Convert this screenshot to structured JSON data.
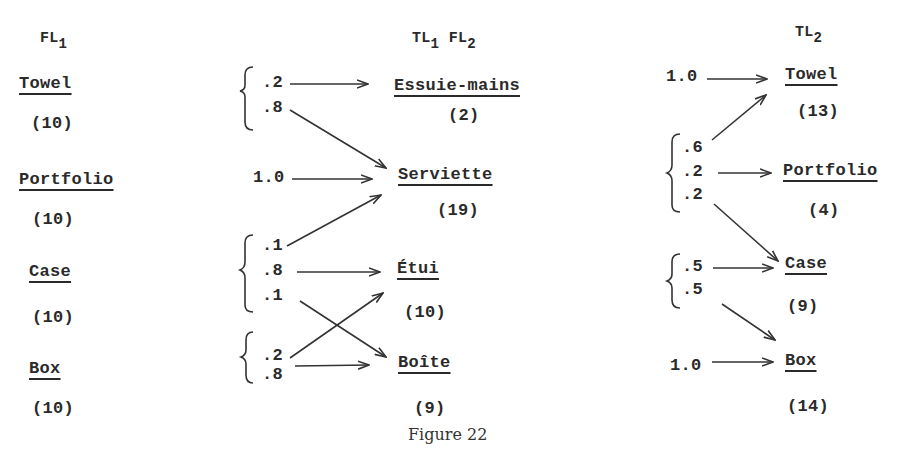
{
  "figure": {
    "caption": "Figure 22",
    "columns": [
      {
        "id": "fl1",
        "header_main": "FL",
        "header_sub": "1",
        "terms": [
          {
            "word": "Towel",
            "count": "(10)"
          },
          {
            "word": "Portfolio",
            "count": "(10)"
          },
          {
            "word": "Case",
            "count": "(10)"
          },
          {
            "word": "Box",
            "count": "(10)"
          }
        ]
      },
      {
        "id": "tl1fl2",
        "header_main_1": "TL",
        "header_sub_1": "1",
        "header_main_2": "FL",
        "header_sub_2": "2",
        "terms": [
          {
            "word": "Essuie-mains",
            "count": "(2)"
          },
          {
            "word": "Serviette",
            "count": "(19)"
          },
          {
            "word": "Étui",
            "count": "(10)"
          },
          {
            "word": "Boîte",
            "count": "(9)"
          }
        ]
      },
      {
        "id": "tl2",
        "header_main": "TL",
        "header_sub": "2",
        "terms": [
          {
            "word": "Towel",
            "count": "(13)"
          },
          {
            "word": "Portfolio",
            "count": "(4)"
          },
          {
            "word": "Case",
            "count": "(9)"
          },
          {
            "word": "Box",
            "count": "(14)"
          }
        ]
      }
    ],
    "transitions_1": {
      "towel": [
        ".2",
        ".8"
      ],
      "portfolio": [
        "1.0"
      ],
      "case": [
        ".1",
        ".8",
        ".1"
      ],
      "box": [
        ".2",
        ".8"
      ]
    },
    "transitions_2": {
      "essuie_mains": [
        "1.0"
      ],
      "serviette": [
        ".6",
        ".2",
        ".2"
      ],
      "etui": [
        ".5",
        ".5"
      ],
      "boite": [
        "1.0"
      ]
    },
    "edges_1": [
      {
        "from": "Towel",
        "to": "Essuie-mains",
        "p": ".2"
      },
      {
        "from": "Towel",
        "to": "Serviette",
        "p": ".8"
      },
      {
        "from": "Portfolio",
        "to": "Serviette",
        "p": "1.0"
      },
      {
        "from": "Case",
        "to": "Serviette",
        "p": ".1"
      },
      {
        "from": "Case",
        "to": "Étui",
        "p": ".8"
      },
      {
        "from": "Case",
        "to": "Boîte",
        "p": ".1"
      },
      {
        "from": "Box",
        "to": "Étui",
        "p": ".2"
      },
      {
        "from": "Box",
        "to": "Boîte",
        "p": ".8"
      }
    ],
    "edges_2": [
      {
        "from": "Essuie-mains",
        "to": "Towel",
        "p": "1.0"
      },
      {
        "from": "Serviette",
        "to": "Towel",
        "p": ".6"
      },
      {
        "from": "Serviette",
        "to": "Portfolio",
        "p": ".2"
      },
      {
        "from": "Serviette",
        "to": "Case",
        "p": ".2"
      },
      {
        "from": "Étui",
        "to": "Case",
        "p": ".5"
      },
      {
        "from": "Étui",
        "to": "Box",
        "p": ".5"
      },
      {
        "from": "Boîte",
        "to": "Box",
        "p": "1.0"
      }
    ]
  }
}
